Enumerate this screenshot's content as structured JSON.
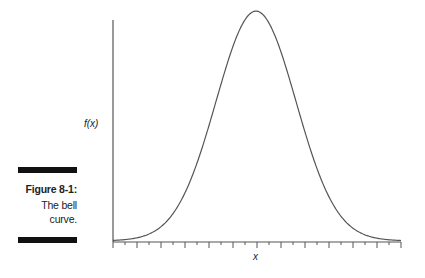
{
  "chart_data": {
    "type": "line",
    "title": "",
    "xlabel": "x",
    "ylabel": "f(x)",
    "curve": "normal distribution (bell curve), symmetric about the mean",
    "x_ticks": "unlabeled, alternating long and short marks",
    "grid": false,
    "legend": null,
    "caption": {
      "label": "Figure 8-1:",
      "text": "The bell curve."
    }
  },
  "caption": {
    "label": "Figure 8-1:",
    "line1": "The bell",
    "line2": "curve."
  },
  "axes": {
    "xlabel": "x",
    "ylabel": "f(x)"
  },
  "colors": {
    "curve": "#555555",
    "axis": "#555555",
    "caption_bar": "#111111"
  }
}
